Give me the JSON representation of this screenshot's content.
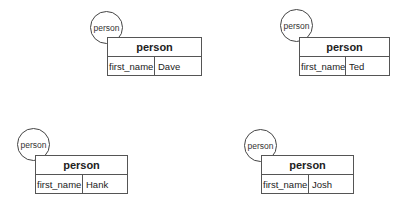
{
  "nodes": [
    {
      "circle_label": "person",
      "entity": "person",
      "field": "first_name",
      "value": "Dave"
    },
    {
      "circle_label": "person",
      "entity": "person",
      "field": "first_name",
      "value": "Ted"
    },
    {
      "circle_label": "person",
      "entity": "person",
      "field": "first_name",
      "value": "Hank"
    },
    {
      "circle_label": "person",
      "entity": "person",
      "field": "first_name",
      "value": "Josh"
    }
  ]
}
